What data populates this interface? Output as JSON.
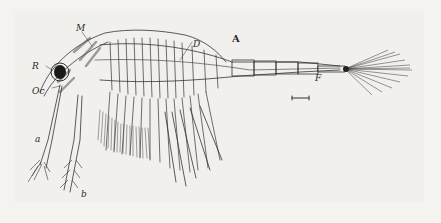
{
  "figure": {
    "panel_label": "A",
    "labels": {
      "M": "M",
      "R": "R",
      "Oc": "Oc",
      "D": "D",
      "F": "F",
      "a": "a",
      "b": "b"
    },
    "scale_bar": true,
    "colors": {
      "ink": "#2a2a2a",
      "paper": "#f4f3f0"
    }
  }
}
